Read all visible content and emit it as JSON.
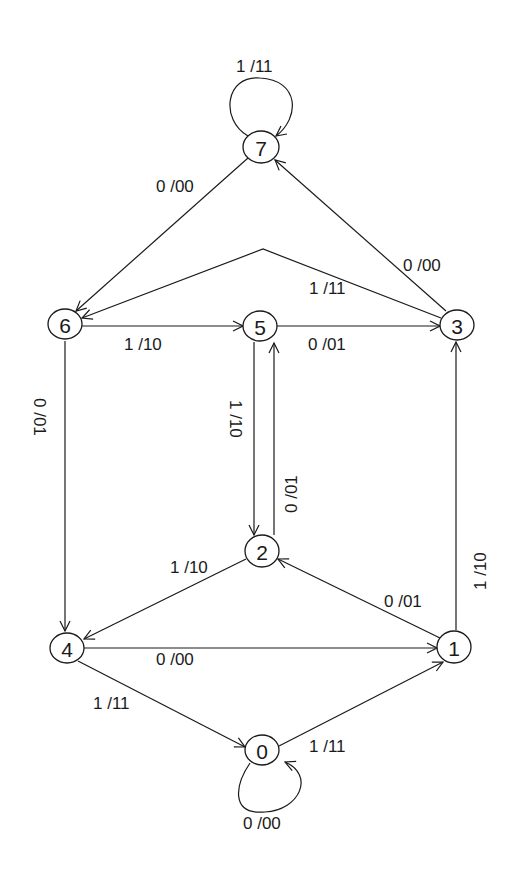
{
  "diagram": {
    "type": "state-transition-diagram",
    "colors": {
      "stroke": "#1a1a1a",
      "background": "#ffffff"
    },
    "nodes": [
      {
        "id": "0",
        "label": "0",
        "x": 262,
        "y": 750
      },
      {
        "id": "1",
        "label": "1",
        "x": 454,
        "y": 647
      },
      {
        "id": "2",
        "label": "2",
        "x": 262,
        "y": 551
      },
      {
        "id": "3",
        "label": "3",
        "x": 457,
        "y": 325
      },
      {
        "id": "4",
        "label": "4",
        "x": 67,
        "y": 648
      },
      {
        "id": "5",
        "label": "5",
        "x": 260,
        "y": 326
      },
      {
        "id": "6",
        "label": "6",
        "x": 65,
        "y": 324
      },
      {
        "id": "7",
        "label": "7",
        "x": 261,
        "y": 147
      }
    ],
    "edges": [
      {
        "from": "7",
        "to": "7",
        "label": "1 /11"
      },
      {
        "from": "7",
        "to": "6",
        "label": "0 /00"
      },
      {
        "from": "3",
        "to": "7",
        "label": "0 /00"
      },
      {
        "from": "3",
        "to": "6",
        "label": "1 /11"
      },
      {
        "from": "6",
        "to": "5",
        "label": "1 /10"
      },
      {
        "from": "5",
        "to": "3",
        "label": "0 /01"
      },
      {
        "from": "6",
        "to": "4",
        "label": "0 /01"
      },
      {
        "from": "5",
        "to": "2",
        "label": "1 /10"
      },
      {
        "from": "2",
        "to": "5",
        "label": "0 /01"
      },
      {
        "from": "1",
        "to": "3",
        "label": "1 /10"
      },
      {
        "from": "2",
        "to": "4",
        "label": "1 /10"
      },
      {
        "from": "1",
        "to": "2",
        "label": "0 /01"
      },
      {
        "from": "4",
        "to": "1",
        "label": "0 /00"
      },
      {
        "from": "4",
        "to": "0",
        "label": "1 /11"
      },
      {
        "from": "0",
        "to": "1",
        "label": "1 /11"
      },
      {
        "from": "0",
        "to": "0",
        "label": "0 /00"
      }
    ]
  }
}
